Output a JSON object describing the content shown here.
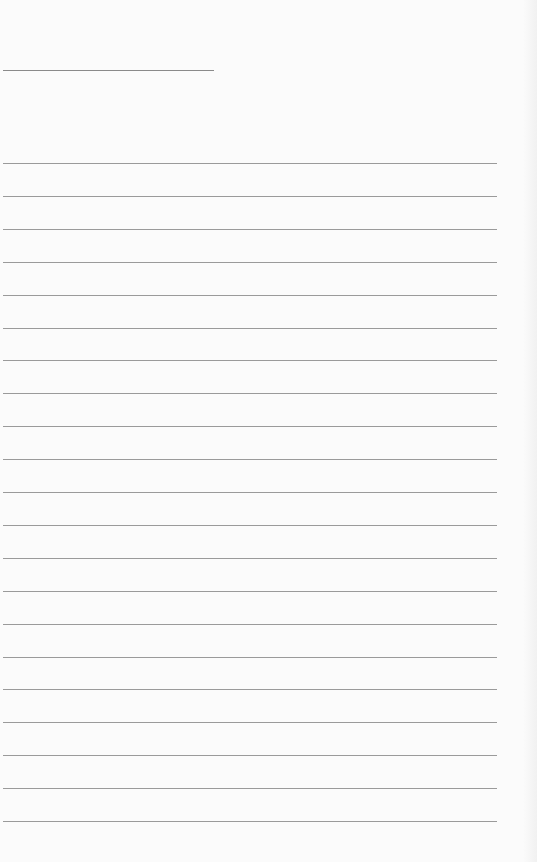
{
  "page": {
    "type": "lined-paper",
    "header_line": {
      "top": 70,
      "width": 211
    },
    "ruled_lines": {
      "count": 21,
      "first_top": 163,
      "spacing": 32.9,
      "width": 494
    },
    "line_color": "#9a9a9a",
    "background": "#fbfbfb"
  }
}
